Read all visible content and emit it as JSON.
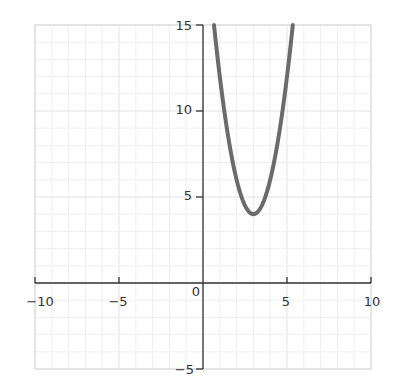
{
  "chart_data": {
    "type": "line",
    "title": "",
    "xlabel": "",
    "ylabel": "",
    "xlim": [
      -10,
      10
    ],
    "ylim": [
      -5,
      15
    ],
    "grid": true,
    "x_ticks": [
      "-10",
      "-5",
      "0",
      "5",
      "10"
    ],
    "y_ticks": [
      "15",
      "10",
      "5",
      "-5"
    ],
    "series": [
      {
        "name": "y = 2(x-3)^2 + 4",
        "color": "#6b6b6b",
        "x": [
          0.65,
          1,
          1.5,
          2,
          2.5,
          3,
          3.5,
          4,
          4.5,
          5,
          5.35
        ],
        "y": [
          15.0,
          12,
          8.5,
          6,
          4.5,
          4,
          4.5,
          6,
          8.5,
          12,
          15.0
        ]
      }
    ],
    "vertex": [
      3,
      4
    ]
  },
  "labels": {
    "x_neg10": "−10",
    "x_neg5": "−5",
    "x_0": "0",
    "x_5": "5",
    "x_10": "10",
    "y_15": "15",
    "y_10": "10",
    "y_5": "5",
    "y_neg5": "−5"
  }
}
